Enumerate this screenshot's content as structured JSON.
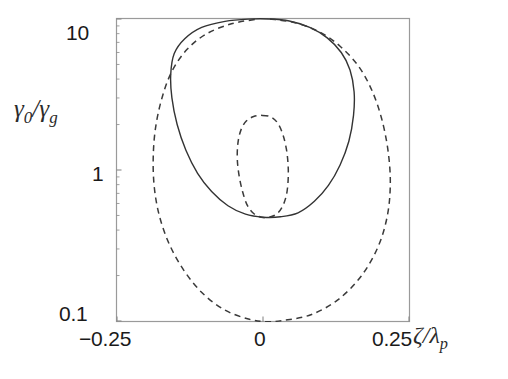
{
  "chart_data": {
    "type": "line",
    "title": "",
    "xlabel": "ζ/λₚ",
    "ylabel": "γ₀/γ_g",
    "xlabel_parts": {
      "num": "ζ",
      "slash": "/",
      "den": "λ",
      "den_sub": "p"
    },
    "ylabel_parts": {
      "num": "γ",
      "num_sub": "0",
      "slash": "/",
      "den": "γ",
      "den_sub": "g"
    },
    "xlim": [
      -0.25,
      0.25
    ],
    "ylim": [
      0.1,
      10
    ],
    "yscale": "log",
    "xscale": "linear",
    "grid": false,
    "legend": false,
    "xticks": [
      -0.25,
      0,
      0.25
    ],
    "xticklabels": [
      "−0.25",
      "0",
      "0.25"
    ],
    "yticks": [
      10,
      1,
      0.1
    ],
    "yticklabels": [
      "10",
      "1",
      "0.1"
    ],
    "series": [
      {
        "name": "solid-separatrix",
        "style": "solid",
        "color": "#333333",
        "closed": true,
        "description": "Closed solid orbit: outer circular separatrix centred near zeta=0.01, spanning zeta from -0.16 to 0.155 and gamma0/gammag from 0.49 to 10.0",
        "points": [
          [
            0.01,
            10.0
          ],
          [
            0.045,
            9.7
          ],
          [
            0.08,
            8.8
          ],
          [
            0.11,
            7.5
          ],
          [
            0.134,
            6.0
          ],
          [
            0.149,
            4.6
          ],
          [
            0.156,
            3.3
          ],
          [
            0.155,
            2.3
          ],
          [
            0.147,
            1.55
          ],
          [
            0.132,
            1.08
          ],
          [
            0.112,
            0.79
          ],
          [
            0.088,
            0.62
          ],
          [
            0.06,
            0.52
          ],
          [
            0.03,
            0.49
          ],
          [
            0.0,
            0.487
          ],
          [
            -0.03,
            0.51
          ],
          [
            -0.06,
            0.58
          ],
          [
            -0.088,
            0.72
          ],
          [
            -0.112,
            0.95
          ],
          [
            -0.132,
            1.35
          ],
          [
            -0.147,
            2.0
          ],
          [
            -0.156,
            3.0
          ],
          [
            -0.158,
            4.3
          ],
          [
            -0.152,
            5.9
          ],
          [
            -0.134,
            7.4
          ],
          [
            -0.105,
            8.8
          ],
          [
            -0.065,
            9.65
          ],
          [
            -0.025,
            9.98
          ],
          [
            0.01,
            10.0
          ]
        ]
      },
      {
        "name": "dashed-outer-separatrix",
        "style": "dashed",
        "color": "#3a3a3a",
        "closed": false,
        "description": "Large dashed orbit, open at top, reaching the bottom axis near zeta=0 at gamma0/gammag=0.1 and extending to zeta=-0.185 and zeta=0.22",
        "points": [
          [
            0.012,
            10.0
          ],
          [
            0.055,
            9.45
          ],
          [
            0.097,
            8.2
          ],
          [
            0.132,
            6.6
          ],
          [
            0.163,
            4.9
          ],
          [
            0.186,
            3.4
          ],
          [
            0.203,
            2.2
          ],
          [
            0.214,
            1.35
          ],
          [
            0.218,
            0.82
          ],
          [
            0.213,
            0.5
          ],
          [
            0.197,
            0.31
          ],
          [
            0.168,
            0.198
          ],
          [
            0.128,
            0.138
          ],
          [
            0.082,
            0.11
          ],
          [
            0.035,
            0.101
          ],
          [
            0.005,
            0.099
          ],
          [
            -0.025,
            0.103
          ],
          [
            -0.065,
            0.118
          ],
          [
            -0.103,
            0.152
          ],
          [
            -0.135,
            0.215
          ],
          [
            -0.16,
            0.32
          ],
          [
            -0.177,
            0.49
          ],
          [
            -0.186,
            0.76
          ],
          [
            -0.188,
            1.2
          ],
          [
            -0.184,
            1.9
          ],
          [
            -0.173,
            3.0
          ],
          [
            -0.156,
            4.5
          ],
          [
            -0.13,
            6.3
          ],
          [
            -0.096,
            8.0
          ],
          [
            -0.054,
            9.3
          ],
          [
            -0.012,
            9.95
          ]
        ]
      },
      {
        "name": "dashed-inner-orbit",
        "style": "dashed",
        "color": "#3a3a3a",
        "closed": true,
        "description": "Small closed dashed orbit centred near zeta=0.0 spanning gamma0/gammag from 0.49 to 2.3",
        "points": [
          [
            -0.001,
            2.3
          ],
          [
            0.013,
            2.25
          ],
          [
            0.025,
            2.05
          ],
          [
            0.034,
            1.72
          ],
          [
            0.04,
            1.38
          ],
          [
            0.043,
            1.08
          ],
          [
            0.043,
            0.85
          ],
          [
            0.04,
            0.68
          ],
          [
            0.033,
            0.57
          ],
          [
            0.023,
            0.51
          ],
          [
            0.01,
            0.486
          ],
          [
            -0.003,
            0.487
          ],
          [
            -0.016,
            0.515
          ],
          [
            -0.027,
            0.585
          ],
          [
            -0.035,
            0.72
          ],
          [
            -0.041,
            0.92
          ],
          [
            -0.044,
            1.18
          ],
          [
            -0.043,
            1.5
          ],
          [
            -0.038,
            1.83
          ],
          [
            -0.029,
            2.1
          ],
          [
            -0.016,
            2.26
          ],
          [
            -0.001,
            2.3
          ]
        ]
      }
    ]
  },
  "axes": {
    "frame_color": "#9a9a9a",
    "tick_color": "#8a8a8a"
  }
}
